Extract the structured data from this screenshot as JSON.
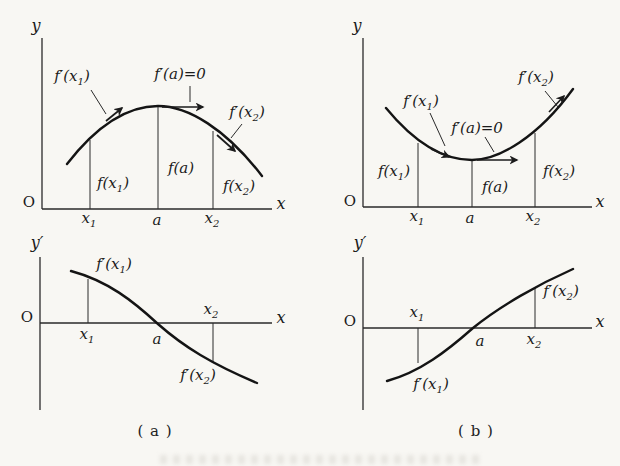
{
  "figure_title": "sign of the derivative and increase/decrease of a function",
  "ink_color": "#1b1b1b",
  "background_color": "#f8f7f3",
  "panels": {
    "top_left": {
      "axis": {
        "y": "y",
        "x": "x",
        "origin": "O"
      },
      "curve_shape": "concave-down curve with maximum at x=a; tangent arrows up-right at x1, horizontal at a, down-right at x2",
      "labels": {
        "fp_x1": {
          "pre": "f′(x",
          "sub": "1",
          "post": ")"
        },
        "fp_a": "f′(a)=0",
        "fp_x2": {
          "pre": "f′(x",
          "sub": "2",
          "post": ")"
        },
        "f_x1": {
          "pre": "f(x",
          "sub": "1",
          "post": ")"
        },
        "f_a": "f(a)",
        "f_x2": {
          "pre": "f(x",
          "sub": "2",
          "post": ")"
        },
        "x1": {
          "pre": "x",
          "sub": "1",
          "post": ""
        },
        "a": "a",
        "x2": {
          "pre": "x",
          "sub": "2",
          "post": ""
        }
      }
    },
    "top_right": {
      "axis": {
        "y": "y",
        "x": "x",
        "origin": "O"
      },
      "curve_shape": "concave-up curve with minimum at x=a; tangent arrows down-right at x1, horizontal at a, up-right at x2",
      "labels": {
        "fp_x1": {
          "pre": "f′(x",
          "sub": "1",
          "post": ")"
        },
        "fp_a": "f′(a)=0",
        "fp_x2": {
          "pre": "f′(x",
          "sub": "2",
          "post": ")"
        },
        "f_x1": {
          "pre": "f(x",
          "sub": "1",
          "post": ")"
        },
        "f_a": "f(a)",
        "f_x2": {
          "pre": "f(x",
          "sub": "2",
          "post": ")"
        },
        "x1": {
          "pre": "x",
          "sub": "1",
          "post": ""
        },
        "a": "a",
        "x2": {
          "pre": "x",
          "sub": "2",
          "post": ""
        }
      }
    },
    "bottom_left": {
      "axis": {
        "y": "y′",
        "x": "x",
        "origin": "O"
      },
      "curve_shape": "derivative graph: decreasing S-curve, positive before a, zero at a, negative after a",
      "labels": {
        "fp_x1": {
          "pre": "f′(x",
          "sub": "1",
          "post": ")"
        },
        "fp_x2": {
          "pre": "f′(x",
          "sub": "2",
          "post": ")"
        },
        "x1": {
          "pre": "x",
          "sub": "1",
          "post": ""
        },
        "a": "a",
        "x2": {
          "pre": "x",
          "sub": "2",
          "post": ""
        }
      }
    },
    "bottom_right": {
      "axis": {
        "y": "y′",
        "x": "x",
        "origin": "O"
      },
      "curve_shape": "derivative graph: increasing S-curve, negative before a, zero at a, positive after a",
      "labels": {
        "fp_x1": {
          "pre": "f′(x",
          "sub": "1",
          "post": ")"
        },
        "fp_x2": {
          "pre": "f′(x",
          "sub": "2",
          "post": ")"
        },
        "x1": {
          "pre": "x",
          "sub": "1",
          "post": ""
        },
        "a": "a",
        "x2": {
          "pre": "x",
          "sub": "2",
          "post": ""
        }
      }
    }
  },
  "captions": {
    "a": "( a )",
    "b": "( b )"
  }
}
